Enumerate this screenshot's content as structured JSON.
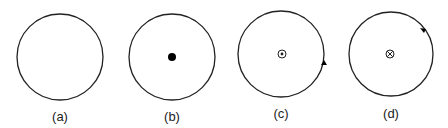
{
  "figure": {
    "panels": [
      {
        "label": "(a)",
        "center_symbol": "none",
        "arrow_direction": "none"
      },
      {
        "label": "(b)",
        "center_symbol": "filled-dot",
        "arrow_direction": "none"
      },
      {
        "label": "(c)",
        "center_symbol": "dot-in-circle (out of page)",
        "arrow_direction": "counterclockwise"
      },
      {
        "label": "(d)",
        "center_symbol": "cross-in-circle (into page)",
        "arrow_direction": "clockwise"
      }
    ]
  }
}
